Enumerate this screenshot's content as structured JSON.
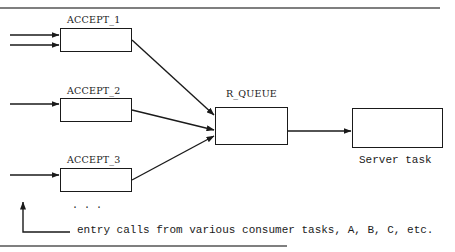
{
  "diagram": {
    "nodes": {
      "accept_1": {
        "label": "ACCEPT_1"
      },
      "accept_2": {
        "label": "ACCEPT_2"
      },
      "accept_3": {
        "label": "ACCEPT_3"
      },
      "r_queue": {
        "label": "R_QUEUE"
      },
      "server": {
        "label": "Server task"
      }
    },
    "ellipsis": ". . .",
    "caption": "entry calls from various consumer tasks, A, B, C, etc.",
    "edges": [
      {
        "from": "external",
        "to": "accept_1",
        "count": 2
      },
      {
        "from": "external",
        "to": "accept_2",
        "count": 1
      },
      {
        "from": "external",
        "to": "accept_3",
        "count": 1
      },
      {
        "from": "accept_1",
        "to": "r_queue"
      },
      {
        "from": "accept_2",
        "to": "r_queue"
      },
      {
        "from": "accept_3",
        "to": "r_queue"
      },
      {
        "from": "r_queue",
        "to": "server"
      }
    ],
    "colors": {
      "stroke": "#1a1a1a",
      "rule": "#555555",
      "background": "#ffffff"
    }
  }
}
